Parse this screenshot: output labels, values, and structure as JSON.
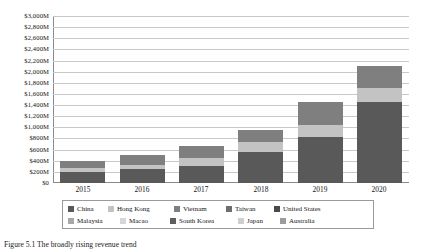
{
  "chart_data": {
    "type": "bar",
    "stacked": true,
    "title": "",
    "xlabel": "",
    "ylabel": "",
    "categories": [
      "2015",
      "2016",
      "2017",
      "2018",
      "2019",
      "2020"
    ],
    "ylim": [
      0,
      3000
    ],
    "ytick_step": 200,
    "ytick_labels": [
      "$3,000M",
      "$2,800M",
      "$2,600M",
      "$2,400M",
      "$2,200M",
      "$2,000M",
      "$1,800M",
      "$1,600M",
      "$1,400M",
      "$1,200M",
      "$1,000M",
      "$800M",
      "$600M",
      "$400M",
      "$200M",
      "$0"
    ],
    "unit": "M",
    "grid": true,
    "legend_position": "bottom",
    "series": [
      {
        "name": "China",
        "color": "#595959",
        "values": [
          190,
          245,
          300,
          560,
          830,
          1450
        ]
      },
      {
        "name": "Hong Kong",
        "color": "#c3c3c3",
        "values": [
          75,
          80,
          150,
          170,
          205,
          255
        ]
      },
      {
        "name": "Vietnam",
        "color": "#7f7f7f",
        "values": [
          125,
          170,
          210,
          225,
          420,
          395
        ]
      },
      {
        "name": "Taiwan",
        "color": "#6e6e6e",
        "values": [
          0,
          0,
          0,
          0,
          0,
          0
        ]
      },
      {
        "name": "United States",
        "color": "#4a4a4a",
        "values": [
          0,
          0,
          0,
          0,
          0,
          0
        ]
      },
      {
        "name": "Malaysia",
        "color": "#a8a8a8",
        "values": [
          0,
          0,
          0,
          0,
          0,
          0
        ]
      },
      {
        "name": "Macao",
        "color": "#d6d6d6",
        "values": [
          0,
          0,
          0,
          0,
          0,
          0
        ]
      },
      {
        "name": "South Korea",
        "color": "#5e5e5e",
        "values": [
          0,
          0,
          0,
          0,
          0,
          0
        ]
      },
      {
        "name": "Japan",
        "color": "#cfcfcf",
        "values": [
          0,
          0,
          0,
          0,
          0,
          0
        ]
      },
      {
        "name": "Australia",
        "color": "#9c9c9c",
        "values": [
          0,
          0,
          0,
          0,
          0,
          0
        ]
      }
    ],
    "totals": [
      390,
      495,
      660,
      955,
      1455,
      2100
    ]
  },
  "legend": {
    "row1": [
      {
        "label": "China",
        "color": "#595959"
      },
      {
        "label": "Hong Kong",
        "color": "#c3c3c3"
      },
      {
        "label": "Vietnam",
        "color": "#7f7f7f"
      },
      {
        "label": "Taiwan",
        "color": "#6e6e6e"
      },
      {
        "label": "United States",
        "color": "#4a4a4a"
      }
    ],
    "row2": [
      {
        "label": "Malaysia",
        "color": "#a8a8a8"
      },
      {
        "label": "Macao",
        "color": "#d6d6d6"
      },
      {
        "label": "South Korea",
        "color": "#5e5e5e"
      },
      {
        "label": "Japan",
        "color": "#cfcfcf"
      },
      {
        "label": "Australia",
        "color": "#9c9c9c"
      }
    ]
  },
  "caption": {
    "text": "Figure 5.1  The broadly rising revenue trend"
  }
}
